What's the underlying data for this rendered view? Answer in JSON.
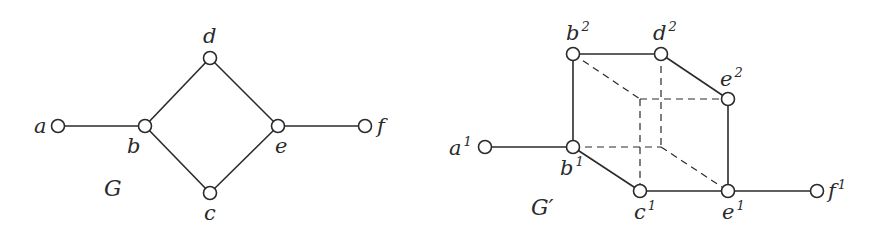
{
  "graphs": [
    {
      "name": "G",
      "name_pos": [
        104,
        196
      ],
      "nodes": [
        {
          "id": "a",
          "label": "a",
          "sup": "",
          "x": 58,
          "y": 126,
          "lx": 34,
          "ly": 133
        },
        {
          "id": "b",
          "label": "b",
          "sup": "",
          "x": 145,
          "y": 126,
          "lx": 127,
          "ly": 153
        },
        {
          "id": "d",
          "label": "d",
          "sup": "",
          "x": 210,
          "y": 58,
          "lx": 203,
          "ly": 43
        },
        {
          "id": "c",
          "label": "c",
          "sup": "",
          "x": 210,
          "y": 193,
          "lx": 204,
          "ly": 220
        },
        {
          "id": "e",
          "label": "e",
          "sup": "",
          "x": 278,
          "y": 126,
          "lx": 275,
          "ly": 153
        },
        {
          "id": "f",
          "label": "f",
          "sup": "",
          "x": 365,
          "y": 126,
          "lx": 377,
          "ly": 133
        }
      ],
      "edges": [
        {
          "from": "a",
          "to": "b",
          "style": "solid"
        },
        {
          "from": "b",
          "to": "d",
          "style": "solid"
        },
        {
          "from": "b",
          "to": "c",
          "style": "solid"
        },
        {
          "from": "d",
          "to": "e",
          "style": "solid"
        },
        {
          "from": "c",
          "to": "e",
          "style": "solid"
        },
        {
          "from": "e",
          "to": "f",
          "style": "solid"
        }
      ]
    },
    {
      "name": "G′",
      "name_pos": [
        531,
        215
      ],
      "nodes": [
        {
          "id": "a1",
          "label": "a",
          "sup": "1",
          "x": 485,
          "y": 147,
          "lx": 449,
          "ly": 155
        },
        {
          "id": "b1",
          "label": "b",
          "sup": "1",
          "x": 573,
          "y": 147,
          "lx": 560,
          "ly": 175
        },
        {
          "id": "b2",
          "label": "b",
          "sup": "2",
          "x": 573,
          "y": 54,
          "lx": 566,
          "ly": 40
        },
        {
          "id": "d2",
          "label": "d",
          "sup": "2",
          "x": 661,
          "y": 54,
          "lx": 653,
          "ly": 40
        },
        {
          "id": "e2",
          "label": "e",
          "sup": "2",
          "x": 728,
          "y": 99,
          "lx": 720,
          "ly": 86
        },
        {
          "id": "c1",
          "label": "c",
          "sup": "1",
          "x": 640,
          "y": 191,
          "lx": 634,
          "ly": 219
        },
        {
          "id": "e1",
          "label": "e",
          "sup": "1",
          "x": 728,
          "y": 191,
          "lx": 722,
          "ly": 219
        },
        {
          "id": "f1",
          "label": "f",
          "sup": "1",
          "x": 817,
          "y": 191,
          "lx": 828,
          "ly": 198
        }
      ],
      "hidden_points": [
        {
          "id": "h1",
          "x": 640,
          "y": 99
        },
        {
          "id": "h2",
          "x": 661,
          "y": 147
        }
      ],
      "edges": [
        {
          "from": "a1",
          "to": "b1",
          "style": "solid"
        },
        {
          "from": "b1",
          "to": "b2",
          "style": "solid"
        },
        {
          "from": "b2",
          "to": "d2",
          "style": "solid"
        },
        {
          "from": "d2",
          "to": "e2",
          "style": "solid"
        },
        {
          "from": "e2",
          "to": "e1",
          "style": "solid"
        },
        {
          "from": "b1",
          "to": "c1",
          "style": "solid"
        },
        {
          "from": "c1",
          "to": "e1",
          "style": "solid"
        },
        {
          "from": "e1",
          "to": "f1",
          "style": "solid"
        },
        {
          "from": "b2",
          "to": "h1",
          "style": "dashed"
        },
        {
          "from": "h1",
          "to": "e2",
          "style": "dashed"
        },
        {
          "from": "h1",
          "to": "c1",
          "style": "dashed"
        },
        {
          "from": "d2",
          "to": "h2",
          "style": "dashed"
        },
        {
          "from": "b1",
          "to": "h2",
          "style": "dashed"
        },
        {
          "from": "h2",
          "to": "e1",
          "style": "dashed"
        }
      ]
    }
  ],
  "style": {
    "stroke": "#2a2a2a",
    "node_fill": "#ffffff",
    "node_radius": 6.5
  }
}
